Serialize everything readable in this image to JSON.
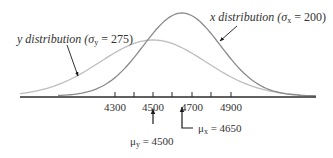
{
  "figure": {
    "type": "normal-distribution-comparison",
    "axis": {
      "tick_labels": [
        "4300",
        "4500",
        "4700",
        "4900"
      ],
      "minor_ticks": [
        "4400",
        "4600",
        "4800"
      ]
    },
    "curves": [
      {
        "id": "x",
        "name": "x distribution",
        "mean": 4650,
        "sd": 200,
        "color": "#8a8a8a"
      },
      {
        "id": "y",
        "name": "y distribution",
        "mean": 4500,
        "sd": 275,
        "color": "#bdbdbd"
      }
    ],
    "labels": {
      "y_dist_prefix": "y distribution (σ",
      "y_dist_sub": "y",
      "y_dist_suffix": " = 275)",
      "x_dist_prefix": "x distribution (σ",
      "x_dist_sub": "x",
      "x_dist_suffix": " = 200)",
      "mu_y_prefix": "μ",
      "mu_y_sub": "y",
      "mu_y_suffix": " = 4500",
      "mu_x_prefix": "μ",
      "mu_x_sub": "x",
      "mu_x_suffix": " = 4650"
    },
    "colors": {
      "axis": "#2b2b2b",
      "x_curve": "#8a8a8a",
      "y_curve": "#bdbdbd",
      "arrow": "#1a1a1a",
      "text": "#333333"
    }
  }
}
